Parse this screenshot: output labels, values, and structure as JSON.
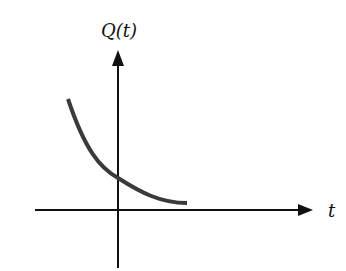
{
  "diagram": {
    "y_axis_label": "Q(t)",
    "x_axis_label": "t",
    "curve_description": "decreasing exponential decay curve crossing the vertical axis",
    "colors": {
      "axes": "#111111",
      "curve": "#3a3a3a",
      "background": "#ffffff"
    }
  }
}
